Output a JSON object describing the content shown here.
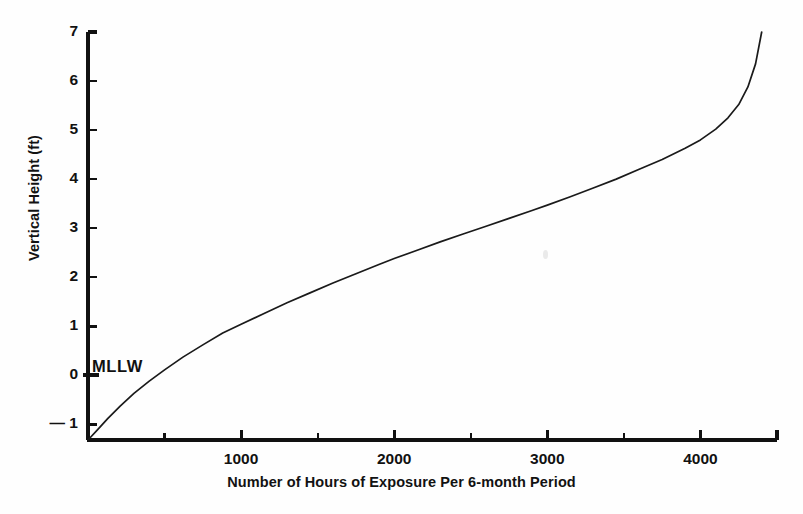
{
  "figure": {
    "background_color": "#fefefe",
    "ink_color": "#111111"
  },
  "annotations": {
    "mllw": "MLLW"
  },
  "chart_data": {
    "type": "line",
    "title": "",
    "xlabel": "Number of Hours of Exposure Per 6-month Period",
    "ylabel": "Vertical Height (ft)",
    "xlim": [
      0,
      4500
    ],
    "ylim": [
      -1.32,
      7.0
    ],
    "grid": false,
    "legend": null,
    "x_major_ticks": [
      1000,
      2000,
      3000,
      4000
    ],
    "x_major_tick_labels": [
      "1000",
      "2000",
      "3000",
      "4000"
    ],
    "x_minor_ticks": [
      500,
      1500,
      2500,
      3500,
      4500
    ],
    "y_ticks": [
      -1,
      0,
      1,
      2,
      3,
      4,
      5,
      6,
      7
    ],
    "y_tick_labels": [
      "1",
      "0",
      "1",
      "2",
      "3",
      "4",
      "5",
      "6",
      "7"
    ],
    "y_tick_label_negative_prefix": "— ",
    "series": [
      {
        "name": "Tidal exposure curve",
        "color": "#1a1a1a",
        "line_width": 1.7,
        "x": [
          0,
          60,
          130,
          210,
          300,
          400,
          500,
          620,
          750,
          880,
          1000,
          1150,
          1300,
          1450,
          1600,
          1750,
          1900,
          2000,
          2150,
          2300,
          2450,
          2600,
          2750,
          2900,
          3000,
          3150,
          3300,
          3450,
          3600,
          3750,
          3900,
          4000,
          4100,
          4180,
          4250,
          4310,
          4360,
          4400
        ],
        "y": [
          -1.32,
          -1.12,
          -0.88,
          -0.63,
          -0.37,
          -0.12,
          0.11,
          0.37,
          0.62,
          0.86,
          1.04,
          1.26,
          1.48,
          1.68,
          1.88,
          2.07,
          2.26,
          2.38,
          2.55,
          2.72,
          2.88,
          3.04,
          3.2,
          3.36,
          3.47,
          3.64,
          3.82,
          4.0,
          4.2,
          4.4,
          4.63,
          4.8,
          5.02,
          5.25,
          5.52,
          5.88,
          6.35,
          7.0
        ]
      }
    ],
    "annotations": [
      {
        "text": "MLLW",
        "x": 0,
        "y": 0,
        "description": "Mean Lower Low Water datum marked at vertical height 0 ft"
      }
    ]
  }
}
